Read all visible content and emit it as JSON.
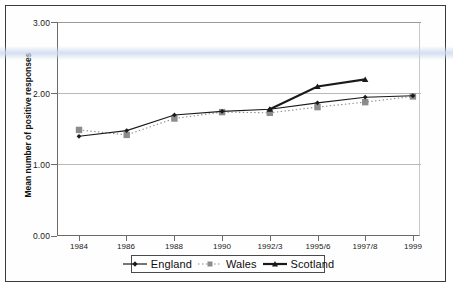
{
  "chart_data": {
    "type": "line",
    "title": "",
    "xlabel": "",
    "ylabel": "Mean number of positive responses",
    "categories": [
      "1984",
      "1986",
      "1988",
      "1990",
      "1992/3",
      "1995/6",
      "1997/8",
      "1999"
    ],
    "ylim": [
      0.0,
      3.0
    ],
    "ytick_labels": [
      "0.00",
      "1.00",
      "2.00",
      "3.00"
    ],
    "ytick_values": [
      0.0,
      1.0,
      2.0,
      3.0
    ],
    "grid": "horizontal",
    "legend_position": "bottom",
    "series": [
      {
        "name": "England",
        "color": "#1a1a1a",
        "marker": "diamond",
        "line_style": "solid",
        "line_width": 1.1,
        "values": [
          1.4,
          1.48,
          1.7,
          1.75,
          1.78,
          1.87,
          1.95,
          1.97
        ]
      },
      {
        "name": "Wales",
        "color": "#8c8c8c",
        "marker": "square",
        "line_style": "dotted",
        "line_width": 1.1,
        "values": [
          1.49,
          1.42,
          1.65,
          1.74,
          1.73,
          1.81,
          1.88,
          1.96
        ]
      },
      {
        "name": "Scotland",
        "color": "#1a1a1a",
        "marker": "triangle",
        "line_style": "solid",
        "line_width": 2.1,
        "values": [
          null,
          null,
          null,
          null,
          1.78,
          2.1,
          2.2,
          null
        ]
      }
    ]
  },
  "legend": {
    "items": [
      {
        "label": "England"
      },
      {
        "label": "Wales"
      },
      {
        "label": "Scotland"
      }
    ]
  }
}
